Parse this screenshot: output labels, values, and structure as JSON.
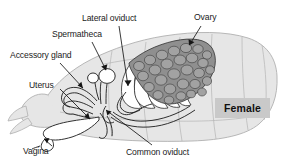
{
  "figure": {
    "width": 282,
    "height": 162,
    "background_color": "#ffffff"
  },
  "badge": {
    "text": "Female",
    "background_color": "#c9c9c9",
    "text_color": "#101010"
  },
  "labels": [
    {
      "id": "lateral-oviduct",
      "text": "Lateral oviduct",
      "x": 82,
      "y": 14
    },
    {
      "id": "ovary",
      "text": "Ovary",
      "x": 194,
      "y": 13
    },
    {
      "id": "spermatheca",
      "text": "Spermatheca",
      "x": 52,
      "y": 30
    },
    {
      "id": "accessory-gland",
      "text": "Accessory gland",
      "x": 10,
      "y": 51
    },
    {
      "id": "uterus",
      "text": "Uterus",
      "x": 29,
      "y": 81
    },
    {
      "id": "vagina",
      "text": "Vagina",
      "x": 23,
      "y": 147
    },
    {
      "id": "common-oviduct",
      "text": "Common oviduct",
      "x": 126,
      "y": 148
    }
  ],
  "colors": {
    "body_fill": "#e3e3e3",
    "body_outline": "#a8a8a8",
    "organ_outline": "#1b1b1b",
    "organ_fill": "#ffffff",
    "ovary_fill": "#8d8d8d",
    "ovary_cell": "#9a9a9a",
    "leader_line": "#1b1b1b",
    "text": "#1b1b1b"
  },
  "structures": [
    {
      "id": "abdomen-outline",
      "name": "insect abdomen silhouette"
    },
    {
      "id": "ovary-follicles",
      "name": "ovary with ovarioles and developing oocytes"
    },
    {
      "id": "ovariole-tubes",
      "name": "ovariole tubes converging to lateral oviduct"
    },
    {
      "id": "lateral-oviduct-tube",
      "name": "lateral oviduct"
    },
    {
      "id": "common-oviduct-tube",
      "name": "common oviduct"
    },
    {
      "id": "spermatheca-organ",
      "name": "spermatheca sac"
    },
    {
      "id": "accessory-gland-organ",
      "name": "accessory gland tubes"
    },
    {
      "id": "uterus-organ",
      "name": "uterus"
    },
    {
      "id": "vagina-organ",
      "name": "vagina opening"
    }
  ]
}
